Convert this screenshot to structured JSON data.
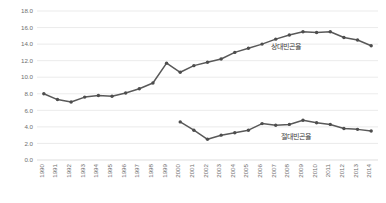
{
  "chart_data": {
    "type": "line",
    "title": "",
    "subtitle": "",
    "xlabel": "",
    "ylabel": "",
    "grid": true,
    "legend_position": "inline-annotation",
    "x": [
      1990,
      1991,
      1992,
      1993,
      1994,
      1995,
      1996,
      1997,
      1998,
      1999,
      2000,
      2001,
      2002,
      2003,
      2004,
      2005,
      2006,
      2007,
      2008,
      2009,
      2010,
      2011,
      2012,
      2013,
      2014
    ],
    "xtick_labels": [
      "1990",
      "1991",
      "1992",
      "1993",
      "1994",
      "1995",
      "1996",
      "1997",
      "1998",
      "1999",
      "2000",
      "2001",
      "2002",
      "2003",
      "2004",
      "2005",
      "2006",
      "2007",
      "2008",
      "2009",
      "2010",
      "2011",
      "2012",
      "2013",
      "2014"
    ],
    "ytick_labels": [
      "18.0",
      "16.0",
      "14.0",
      "12.0",
      "10.0",
      "8.0",
      "6.0",
      "4.0",
      "2.0",
      "0.0"
    ],
    "ytick_values": [
      18.0,
      16.0,
      14.0,
      12.0,
      10.0,
      8.0,
      6.0,
      4.0,
      2.0,
      0.0
    ],
    "ylim": [
      0.0,
      18.0
    ],
    "series": [
      {
        "name": "상대빈곤율",
        "annotation": "상대빈곤율",
        "color": "#595959",
        "x": [
          1990,
          1991,
          1992,
          1993,
          1994,
          1995,
          1996,
          1997,
          1998,
          1999,
          2000,
          2001,
          2002,
          2003,
          2004,
          2005,
          2006,
          2007,
          2008,
          2009,
          2010,
          2011,
          2012,
          2013,
          2014
        ],
        "values": [
          8.0,
          7.3,
          7.0,
          7.6,
          7.8,
          7.7,
          8.1,
          8.6,
          9.3,
          11.7,
          10.6,
          11.4,
          11.8,
          12.2,
          13.0,
          13.5,
          14.0,
          14.6,
          15.1,
          15.5,
          15.4,
          15.5,
          14.8,
          14.5,
          13.8
        ]
      },
      {
        "name": "절대빈곤율",
        "annotation": "절대빈곤율",
        "color": "#595959",
        "x": [
          2000,
          2001,
          2002,
          2003,
          2004,
          2005,
          2006,
          2007,
          2008,
          2009,
          2010,
          2011,
          2012,
          2013,
          2014
        ],
        "values": [
          4.6,
          3.6,
          2.5,
          3.0,
          3.3,
          3.6,
          4.4,
          4.2,
          4.3,
          4.8,
          4.5,
          4.3,
          3.8,
          3.7,
          3.5
        ]
      }
    ],
    "annotations": [
      {
        "text": "상대빈곤율",
        "series": "상대빈곤율"
      },
      {
        "text": "절대빈곤율",
        "series": "절대빈곤율"
      }
    ]
  }
}
